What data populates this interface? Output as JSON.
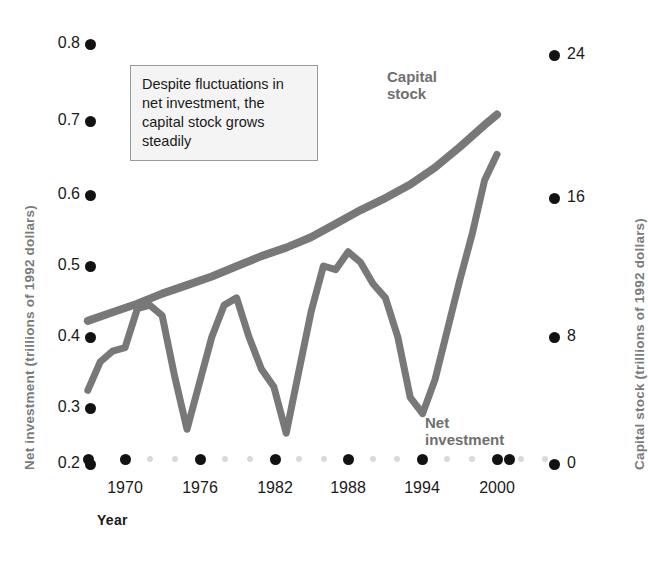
{
  "chart_data": {
    "type": "line",
    "title": "",
    "xlabel": "Year",
    "annotation": "Despite fluctuations in net investment, the capital stock grows steadily",
    "grid": false,
    "legend_position": "inline-labels",
    "colors": {
      "series_line": "#787878",
      "tick_dot_major": "#121212",
      "tick_dot_minor": "#d9d9d9",
      "axis_title": "#7b7b7b",
      "annotation_bg": "#f4f4f4",
      "annotation_border": "#9a9a9a"
    },
    "x_axis": {
      "label": "Year",
      "tick_labels": [
        "1970",
        "1976",
        "1982",
        "1988",
        "1994",
        "2000"
      ],
      "tick_values": [
        1970,
        1976,
        1982,
        1988,
        1994,
        2000
      ],
      "range": [
        1967,
        2001
      ],
      "minor_ticks_between": 2
    },
    "y_axis_left": {
      "label": "Net investment (trillions of 1992 dollars)",
      "tick_labels": [
        "0.2",
        "0.3",
        "0.4",
        "0.5",
        "0.6",
        "0.7",
        "0.8"
      ],
      "tick_values": [
        0.2,
        0.3,
        0.4,
        0.5,
        0.6,
        0.7,
        0.8
      ],
      "range": [
        0.2,
        0.8
      ]
    },
    "y_axis_right": {
      "label": "Capital stock (trillions of 1992 dollars)",
      "tick_labels": [
        "0",
        "8",
        "16",
        "24"
      ],
      "tick_values": [
        0,
        8,
        16,
        24
      ],
      "range": [
        0,
        24
      ]
    },
    "series": [
      {
        "name": "Capital stock",
        "axis": "right",
        "units": "trillions of 1992 dollars",
        "x": [
          1967,
          1969,
          1971,
          1973,
          1975,
          1977,
          1979,
          1981,
          1983,
          1985,
          1987,
          1989,
          1991,
          1993,
          1995,
          1997,
          1999,
          2000
        ],
        "values": [
          8.4,
          8.9,
          9.4,
          10.0,
          10.5,
          11.0,
          11.6,
          12.2,
          12.7,
          13.3,
          14.1,
          14.9,
          15.6,
          16.4,
          17.4,
          18.6,
          19.9,
          20.5
        ]
      },
      {
        "name": "Net investment",
        "axis": "left",
        "units": "trillions of 1992 dollars",
        "x": [
          1967,
          1968,
          1969,
          1970,
          1971,
          1972,
          1973,
          1974,
          1975,
          1976,
          1977,
          1978,
          1979,
          1980,
          1981,
          1982,
          1983,
          1984,
          1985,
          1986,
          1987,
          1988,
          1989,
          1990,
          1991,
          1992,
          1993,
          1994,
          1995,
          1996,
          1997,
          1998,
          1999,
          2000
        ],
        "values": [
          0.325,
          0.365,
          0.38,
          0.385,
          0.44,
          0.445,
          0.43,
          0.345,
          0.262,
          0.335,
          0.4,
          0.445,
          0.455,
          0.4,
          0.355,
          0.33,
          0.255,
          0.35,
          0.435,
          0.5,
          0.495,
          0.52,
          0.505,
          0.475,
          0.455,
          0.4,
          0.315,
          0.29,
          0.34,
          0.41,
          0.48,
          0.545,
          0.62,
          0.655
        ]
      }
    ]
  },
  "y_left_ticks": [
    {
      "label": "0.8",
      "px": 44
    },
    {
      "label": "0.7",
      "px": 121
    },
    {
      "label": "0.6",
      "px": 195
    },
    {
      "label": "0.5",
      "px": 266
    },
    {
      "label": "0.4",
      "px": 337
    },
    {
      "label": "0.3",
      "px": 408
    },
    {
      "label": "0.2",
      "px": 464
    }
  ],
  "y_right_ticks": [
    {
      "label": "24",
      "px": 55
    },
    {
      "label": "16",
      "px": 198
    },
    {
      "label": "8",
      "px": 337
    },
    {
      "label": "0",
      "px": 464
    }
  ],
  "x_ticks": [
    {
      "label": "1970",
      "px": 125
    },
    {
      "label": "1976",
      "px": 200
    },
    {
      "label": "1982",
      "px": 275
    },
    {
      "label": "1988",
      "px": 348
    },
    {
      "label": "1994",
      "px": 422
    },
    {
      "label": "2000",
      "px": 497
    }
  ],
  "axis_titles": {
    "left": "Net investment (trillions of 1992 dollars)",
    "right": "Capital stock (trillions of 1992 dollars)",
    "bottom": "Year"
  },
  "series_labels": {
    "capital": "Capital\nstock",
    "net": "Net\ninvestment"
  },
  "annotation": {
    "text": "Despite fluctuations in net investment, the capital stock grows steadily"
  }
}
